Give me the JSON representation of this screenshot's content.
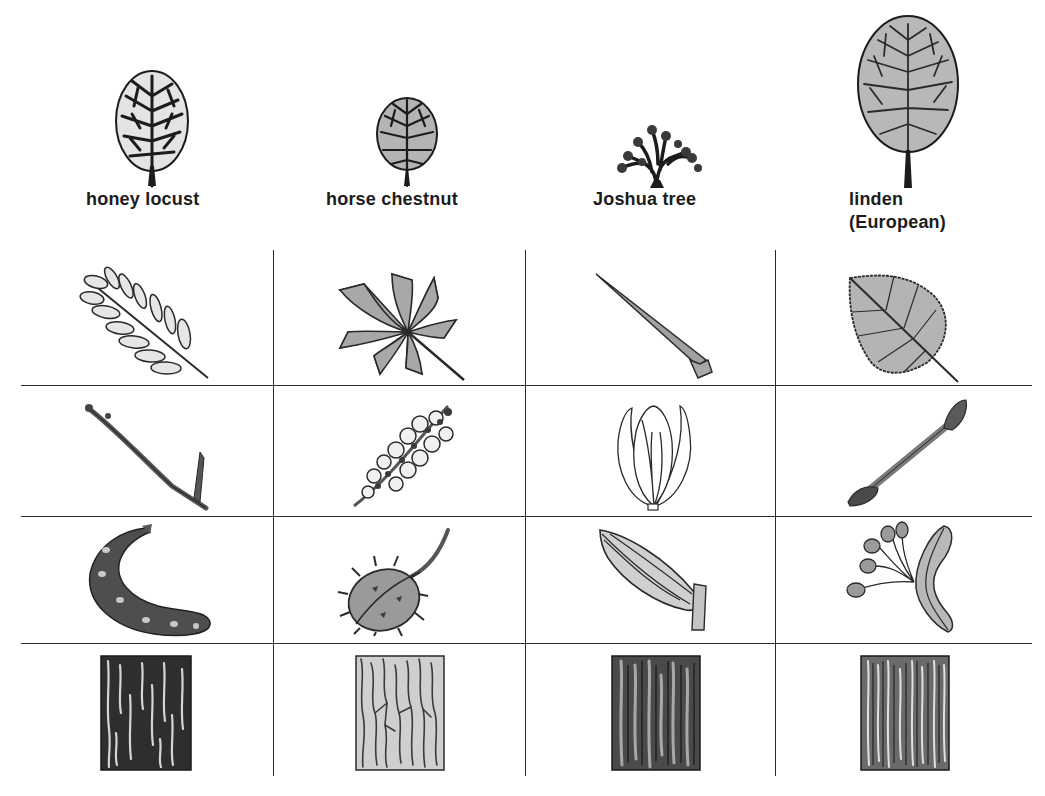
{
  "figure": {
    "row_kinds": [
      "silhouette",
      "leaf",
      "twig-or-flower",
      "fruit",
      "bark"
    ]
  },
  "trees": [
    {
      "name": "honey locust",
      "label_lines": [
        "honey locust"
      ],
      "silhouette": "rounded open crown",
      "leaf": "pinnately compound leaf",
      "twig": "twig with thorn",
      "fruit": "curved seed pod",
      "bark": "dark furrowed bark"
    },
    {
      "name": "horse chestnut",
      "label_lines": [
        "horse chestnut"
      ],
      "silhouette": "oval dense crown",
      "leaf": "palmately compound leaf",
      "twig": "flower cluster (panicle)",
      "fruit": "spiny husk with stem",
      "bark": "light scaly bark"
    },
    {
      "name": "Joshua tree",
      "label_lines": [
        "Joshua tree"
      ],
      "silhouette": "branching spiky shrub form",
      "leaf": "long narrow spine-tipped leaf",
      "twig": "closed flower bud",
      "fruit": "ridged oval fruit",
      "bark": "dark ridged bark"
    },
    {
      "name": "linden (European)",
      "label_lines": [
        "linden",
        "(European)"
      ],
      "silhouette": "tall oval crown",
      "leaf": "heart-shaped serrated leaf",
      "twig": "twig with buds",
      "fruit": "nutlets with leafy bract",
      "bark": "grey ridged bark"
    }
  ],
  "colors": {
    "line": "#2a2a2a",
    "ink": "#1c1c1c",
    "fill_light": "#d6d6d6",
    "fill_mid": "#a8a8a8",
    "fill_dark": "#4a4a4a"
  }
}
